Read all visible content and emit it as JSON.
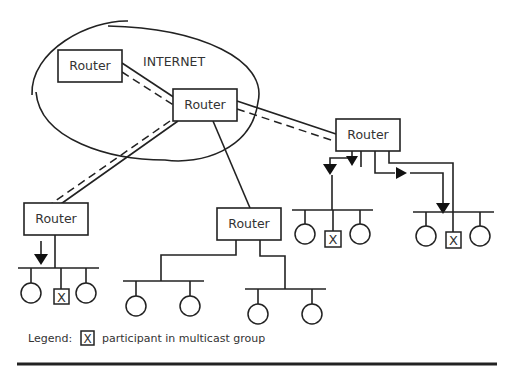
{
  "diagram": {
    "cloud_label": "INTERNET",
    "routers": [
      {
        "id": "r-top-left",
        "label": "Router"
      },
      {
        "id": "r-center",
        "label": "Router"
      },
      {
        "id": "r-right",
        "label": "Router"
      },
      {
        "id": "r-left",
        "label": "Router"
      },
      {
        "id": "r-bottom-mid",
        "label": "Router"
      }
    ],
    "participant_mark": "X",
    "legend": {
      "label": "Legend:",
      "symbol": "X",
      "text": "participant in multicast group"
    }
  }
}
